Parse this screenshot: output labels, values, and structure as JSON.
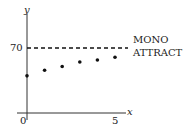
{
  "chart_data": {
    "type": "scatter",
    "title": "",
    "xlabel": "x",
    "ylabel": "y",
    "x": [
      0,
      1,
      2,
      3,
      4,
      5
    ],
    "series": [
      {
        "name": "points",
        "values": [
          40,
          46,
          50,
          55,
          57,
          60
        ]
      }
    ],
    "reference_line": {
      "y": 70,
      "style": "dashed",
      "label_line1": "MONO",
      "label_line2": "ATTRACT"
    },
    "x_ticks": [
      "0",
      "5"
    ],
    "y_ticks": [
      "70"
    ],
    "xlim": [
      0,
      5.5
    ],
    "ylim": [
      0,
      85
    ],
    "grid": false,
    "legend": "none"
  }
}
